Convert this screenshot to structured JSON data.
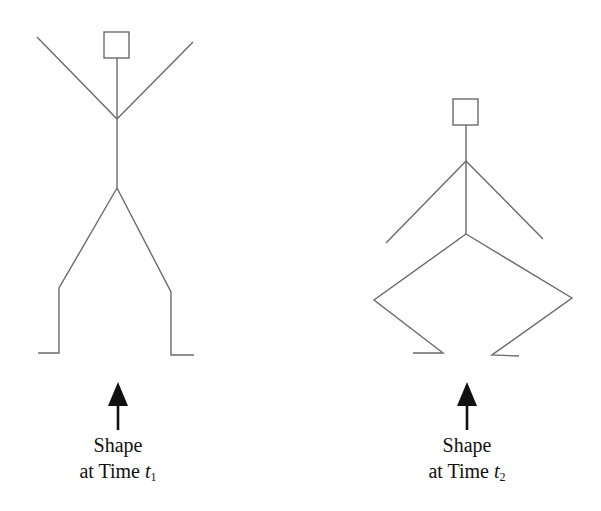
{
  "figure": {
    "stroke_color": "#6a6a6a",
    "arrow_color": "#111111",
    "figures": [
      {
        "id": "t1",
        "caption_line1": "Shape",
        "caption_line2_prefix": "at Time ",
        "caption_var": "t",
        "caption_sub": "1",
        "pose": "standing, arms raised"
      },
      {
        "id": "t2",
        "caption_line1": "Shape",
        "caption_line2_prefix": "at Time ",
        "caption_var": "t",
        "caption_sub": "2",
        "pose": "squatting, arms lowered"
      }
    ]
  }
}
